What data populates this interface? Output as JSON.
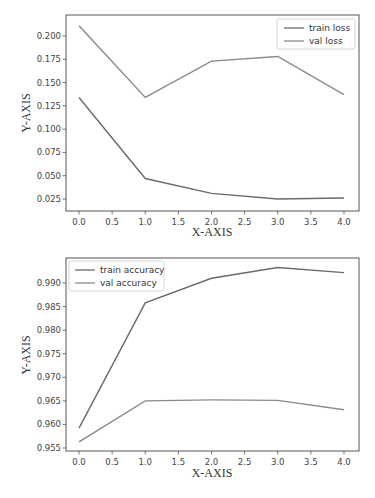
{
  "chart_data": [
    {
      "type": "line",
      "title": "",
      "xlabel": "X-AXIS",
      "ylabel": "Y-AXIS",
      "x": [
        0,
        1,
        2,
        3,
        4
      ],
      "xticks": [
        "0.0",
        "0.5",
        "1.0",
        "1.5",
        "2.0",
        "2.5",
        "3.0",
        "3.5",
        "4.0"
      ],
      "yticks": [
        "0.025",
        "0.050",
        "0.075",
        "0.100",
        "0.125",
        "0.150",
        "0.175",
        "0.200"
      ],
      "xlim": [
        -0.2,
        4.2
      ],
      "ylim": [
        0.0145,
        0.2215
      ],
      "grid": false,
      "legend_position": "upper right",
      "series": [
        {
          "name": "train loss",
          "values": [
            0.134,
            0.047,
            0.031,
            0.025,
            0.026
          ]
        },
        {
          "name": "val loss",
          "values": [
            0.211,
            0.134,
            0.173,
            0.178,
            0.137
          ]
        }
      ]
    },
    {
      "type": "line",
      "title": "",
      "xlabel": "X-AXIS",
      "ylabel": "Y-AXIS",
      "x": [
        0,
        1,
        2,
        3,
        4
      ],
      "xticks": [
        "0.0",
        "0.5",
        "1.0",
        "1.5",
        "2.0",
        "2.5",
        "3.0",
        "3.5",
        "4.0"
      ],
      "yticks": [
        "0.955",
        "0.960",
        "0.965",
        "0.970",
        "0.975",
        "0.980",
        "0.985",
        "0.990"
      ],
      "xlim": [
        -0.2,
        4.2
      ],
      "ylim": [
        0.9544,
        0.9947
      ],
      "grid": false,
      "legend_position": "upper left",
      "series": [
        {
          "name": "train accuracy",
          "values": [
            0.9592,
            0.9858,
            0.991,
            0.9933,
            0.9922
          ]
        },
        {
          "name": "val accuracy",
          "values": [
            0.9563,
            0.965,
            0.9652,
            0.9651,
            0.9631
          ]
        }
      ]
    }
  ],
  "colors": {
    "line": "#6b6b6b",
    "frame": "#555555",
    "text": "#444444"
  }
}
